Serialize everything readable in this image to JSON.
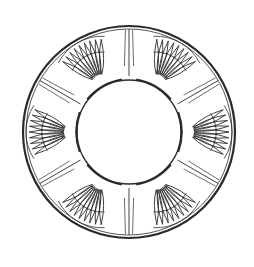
{
  "figure": {
    "width": 254,
    "height": 267,
    "center": [
      129,
      132
    ],
    "outer_radius": 106,
    "inner_radius": 52,
    "stroke_color": "#2b2b2b",
    "background": "#ffffff",
    "motif_count": 6,
    "motif_angles_deg": [
      30,
      90,
      150,
      210,
      270,
      330
    ],
    "petals_per_fan": 9,
    "fan_span_deg": 58
  }
}
